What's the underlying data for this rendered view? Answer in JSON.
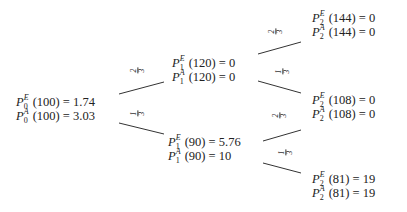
{
  "diagram": {
    "type": "binomial-tree",
    "nodes": {
      "root": {
        "E_label": "E",
        "A_label": "A",
        "step": "0",
        "price": "(100)",
        "E_value": "= 1.74",
        "A_value": "= 3.03"
      },
      "up": {
        "E_label": "E",
        "A_label": "A",
        "step": "1",
        "price": "(120)",
        "E_value": "= 0",
        "A_value": "= 0"
      },
      "down": {
        "E_label": "E",
        "A_label": "A",
        "step": "1",
        "price": "(90)",
        "E_value": "= 5.76",
        "A_value": "= 10"
      },
      "uu": {
        "E_label": "E",
        "A_label": "A",
        "step": "2",
        "price": "(144)",
        "E_value": "= 0",
        "A_value": "= 0"
      },
      "ud": {
        "E_label": "E",
        "A_label": "A",
        "step": "2",
        "price": "(108)",
        "E_value": "= 0",
        "A_value": "= 0"
      },
      "dd": {
        "E_label": "E",
        "A_label": "A",
        "step": "2",
        "price": "(81)",
        "E_value": "= 19",
        "A_value": "= 19"
      }
    },
    "symbol": "P",
    "edges": [
      {
        "from": "root",
        "to": "up",
        "prob_num": "2",
        "prob_den": "3"
      },
      {
        "from": "root",
        "to": "down",
        "prob_num": "1",
        "prob_den": "3"
      },
      {
        "from": "up",
        "to": "uu",
        "prob_num": "2",
        "prob_den": "3"
      },
      {
        "from": "up",
        "to": "ud",
        "prob_num": "1",
        "prob_den": "3"
      },
      {
        "from": "down",
        "to": "ud",
        "prob_num": "2",
        "prob_den": "3"
      },
      {
        "from": "down",
        "to": "dd",
        "prob_num": "1",
        "prob_den": "3"
      }
    ],
    "line_color": "#333333"
  }
}
